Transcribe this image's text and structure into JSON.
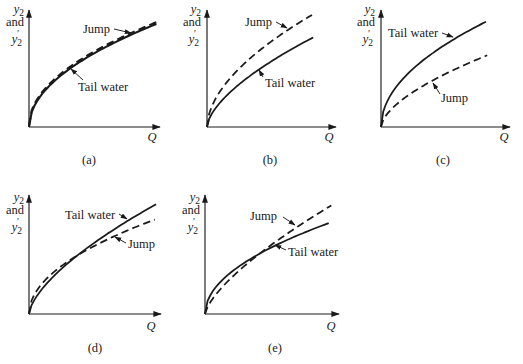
{
  "colors": {
    "ink": "#1a1a1a",
    "background": "#ffffff"
  },
  "axes": {
    "x_label": "Q",
    "y_label_line1": {
      "base": "y",
      "sub": "2"
    },
    "y_label_line2": "and",
    "y_label_line3": {
      "base": "y",
      "sub": "2",
      "prime": "′"
    }
  },
  "chart_data": [
    {
      "panel": "(a)",
      "type": "line",
      "x_axis_label": "Q",
      "y_axis_label": "y2 and y2′",
      "series": [
        {
          "name": "Tail water",
          "style": "solid",
          "xmax": 0.98,
          "ymax": 0.92,
          "p": 0.5,
          "offset_px": 0
        },
        {
          "name": "Jump",
          "style": "dashed",
          "xmax": 0.98,
          "ymax": 0.92,
          "p": 0.5,
          "offset_px": -1.7
        }
      ]
    },
    {
      "panel": "(b)",
      "type": "line",
      "x_axis_label": "Q",
      "y_axis_label": "y2 and y2′",
      "series": [
        {
          "name": "Tail water",
          "style": "solid",
          "xmax": 0.83,
          "ymax": 0.8,
          "p": 0.62,
          "offset_px": 0
        },
        {
          "name": "Jump",
          "style": "dashed",
          "xmax": 0.82,
          "ymax": 1.0,
          "p": 0.55,
          "offset_px": 0
        }
      ]
    },
    {
      "panel": "(c)",
      "type": "line",
      "x_axis_label": "Q",
      "y_axis_label": "y2 and y2′",
      "series": [
        {
          "name": "Tail water",
          "style": "solid",
          "xmax": 0.82,
          "ymax": 0.94,
          "p": 0.5,
          "offset_px": 0
        },
        {
          "name": "Jump",
          "style": "dashed",
          "xmax": 0.83,
          "ymax": 0.64,
          "p": 0.6,
          "offset_px": 0
        }
      ]
    },
    {
      "panel": "(d)",
      "type": "line",
      "x_axis_label": "Q",
      "y_axis_label": "y2 and y2′",
      "series": [
        {
          "name": "Tail water",
          "style": "solid",
          "xmax": 0.97,
          "ymax": 0.93,
          "p": 0.65,
          "offset_px": 0
        },
        {
          "name": "Jump",
          "style": "dashed",
          "xmax": 0.96,
          "ymax": 0.8,
          "p": 0.5,
          "offset_px": 0
        }
      ]
    },
    {
      "panel": "(e)",
      "type": "line",
      "x_axis_label": "Q",
      "y_axis_label": "y2 and y2′",
      "series": [
        {
          "name": "Tail water",
          "style": "solid",
          "xmax": 0.93,
          "ymax": 0.77,
          "p": 0.5,
          "offset_px": 0
        },
        {
          "name": "Jump",
          "style": "dashed",
          "xmax": 0.95,
          "ymax": 0.92,
          "p": 0.7,
          "offset_px": 0
        }
      ]
    }
  ]
}
